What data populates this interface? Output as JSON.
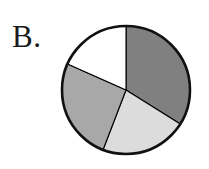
{
  "figure": {
    "panel_label": "B.",
    "background_color": "#ffffff",
    "outline_color": "#111111"
  },
  "chart_data": {
    "type": "pie",
    "title": "B.",
    "subtitle": "",
    "xlabel": "",
    "ylabel": "",
    "legend": "none",
    "grid": false,
    "start_angle_deg": 0,
    "direction": "clockwise",
    "center": {
      "x": 126,
      "y": 90
    },
    "radius": 64,
    "categories": [
      "Dark gray",
      "Light gray",
      "Medium gray",
      "White"
    ],
    "values": [
      34,
      22,
      26,
      18
    ],
    "slices": [
      {
        "name": "Dark gray",
        "value": 34,
        "percent": "34%",
        "start_deg": 0,
        "end_deg": 122,
        "color": "#808080"
      },
      {
        "name": "Light gray",
        "value": 22,
        "percent": "22%",
        "start_deg": 122,
        "end_deg": 201,
        "color": "#dcdcdc"
      },
      {
        "name": "Medium gray",
        "value": 26,
        "percent": "26%",
        "start_deg": 201,
        "end_deg": 294,
        "color": "#a8a8a8"
      },
      {
        "name": "White",
        "value": 18,
        "percent": "18%",
        "start_deg": 294,
        "end_deg": 360,
        "color": "#ffffff"
      }
    ]
  }
}
